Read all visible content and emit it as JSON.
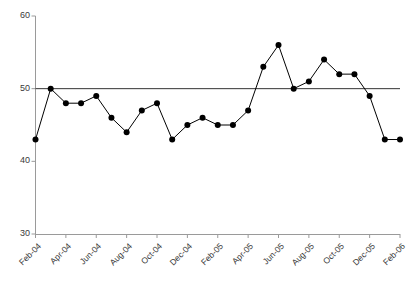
{
  "chart_data": {
    "type": "line",
    "title": "",
    "subtitle": "",
    "xlabel": "",
    "ylabel": "",
    "ylim": [
      30,
      60
    ],
    "yticks": [
      30,
      40,
      50,
      60
    ],
    "ytick_labels": [
      "30",
      "40",
      "50",
      "60"
    ],
    "grid": false,
    "legend": null,
    "reference_line": {
      "value": 50,
      "color": "#333333",
      "style": "solid"
    },
    "marker": {
      "shape": "circle",
      "color": "#000000",
      "size": 3
    },
    "line": {
      "color": "#000000",
      "width": 1
    },
    "categories": [
      "Feb-04",
      "Mar-04",
      "Apr-04",
      "May-04",
      "Jun-04",
      "Jul-04",
      "Aug-04",
      "Sep-04",
      "Oct-04",
      "Nov-04",
      "Dec-04",
      "Jan-05",
      "Feb-05",
      "Mar-05",
      "Apr-05",
      "May-05",
      "Jun-05",
      "Jul-05",
      "Aug-05",
      "Sep-05",
      "Oct-05",
      "Nov-05",
      "Dec-05",
      "Jan-06",
      "Feb-06"
    ],
    "xtick_labels": [
      "Feb-04",
      "Apr-04",
      "Jun-04",
      "Aug-04",
      "Oct-04",
      "Dec-04",
      "Feb-05",
      "Apr-05",
      "Jun-05",
      "Aug-05",
      "Oct-05",
      "Dec-05",
      "Feb-06"
    ],
    "xtick_indices": [
      0,
      2,
      4,
      6,
      8,
      10,
      12,
      14,
      16,
      18,
      20,
      22,
      24
    ],
    "values": [
      43,
      50,
      48,
      48,
      49,
      46,
      44,
      47,
      48,
      43,
      45,
      46,
      45,
      45,
      47,
      53,
      56,
      50,
      51,
      54,
      52,
      52,
      49,
      43,
      43
    ],
    "series": [
      {
        "name": "series-1",
        "values": [
          43,
          50,
          48,
          48,
          49,
          46,
          44,
          47,
          48,
          43,
          45,
          46,
          45,
          45,
          47,
          53,
          56,
          50,
          51,
          54,
          52,
          52,
          49,
          43,
          43
        ]
      }
    ],
    "colors": {
      "axis": "#9a9a9a",
      "tick_text": "#3a3a3a",
      "line": "#000000",
      "marker": "#000000",
      "reference": "#333333",
      "background": "#ffffff"
    }
  }
}
